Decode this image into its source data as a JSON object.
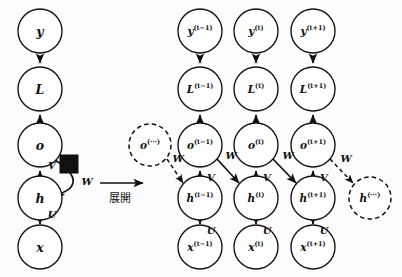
{
  "figure": {
    "background_color": "#fdfdfd",
    "ink_color": "#111111"
  },
  "unfold": {
    "label": "展開",
    "arrow_icon": "right-arrow-icon"
  },
  "folded_graph": {
    "name": "folded-rnn",
    "nodes": [
      {
        "id": "y",
        "base": "y",
        "sup": "",
        "cx": 40,
        "cy": 31,
        "r": 22,
        "dashed": false
      },
      {
        "id": "L",
        "base": "L",
        "sup": "",
        "cx": 40,
        "cy": 89,
        "r": 22,
        "dashed": false
      },
      {
        "id": "o",
        "base": "o",
        "sup": "",
        "cx": 40,
        "cy": 145,
        "r": 22,
        "dashed": false
      },
      {
        "id": "h",
        "base": "h",
        "sup": "",
        "cx": 40,
        "cy": 198,
        "r": 22,
        "dashed": false
      },
      {
        "id": "x",
        "base": "x",
        "sup": "",
        "cx": 40,
        "cy": 247,
        "r": 22,
        "dashed": false
      }
    ],
    "edge_labels": {
      "V": "V",
      "W": "W",
      "U": "U"
    },
    "delay_element": {
      "name": "delay-square",
      "x": 60,
      "y": 155,
      "size": 18
    }
  },
  "unfolded_graph": {
    "name": "unfolded-rnn",
    "time_steps": [
      {
        "index": 0,
        "cx": 200,
        "sup": "(t−1)",
        "y_label": "y",
        "L_label": "L",
        "o_label": "o",
        "h_label": "h",
        "x_label": "x"
      },
      {
        "index": 1,
        "cx": 256,
        "sup": "(t)",
        "y_label": "y",
        "L_label": "L",
        "o_label": "o",
        "h_label": "h",
        "x_label": "x"
      },
      {
        "index": 2,
        "cx": 313,
        "sup": "(t+1)",
        "y_label": "y",
        "L_label": "L",
        "o_label": "o",
        "h_label": "h",
        "x_label": "x"
      }
    ],
    "row_centers": {
      "y": 31,
      "L": 89,
      "o": 145,
      "h": 198,
      "x": 247
    },
    "node_radius": 22,
    "ellipsis_nodes": [
      {
        "id": "o-ellipsis",
        "base": "o",
        "sup": "(⋯)",
        "cx": 150,
        "cy": 145,
        "r": 21,
        "dashed": true
      },
      {
        "id": "h-ellipsis",
        "base": "h",
        "sup": "(⋯)",
        "cx": 370,
        "cy": 198,
        "r": 21,
        "dashed": true
      }
    ],
    "edge_labels": {
      "V": "V",
      "W": "W",
      "U": "U"
    }
  }
}
